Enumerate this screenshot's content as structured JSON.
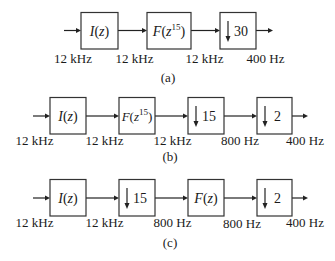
{
  "diagrams": {
    "a": {
      "caption": "(a)",
      "blocks": [
        {
          "kind": "filter",
          "func": "I",
          "arg": "z",
          "exp": ""
        },
        {
          "kind": "filter",
          "func": "F",
          "arg": "z",
          "exp": "15"
        },
        {
          "kind": "downsample",
          "factor": "30"
        }
      ],
      "rates": [
        "12 kHz",
        "12 kHz",
        "12 kHz",
        "400 Hz"
      ]
    },
    "b": {
      "caption": "(b)",
      "blocks": [
        {
          "kind": "filter",
          "func": "I",
          "arg": "z",
          "exp": ""
        },
        {
          "kind": "filter",
          "func": "F",
          "arg": "z",
          "exp": "15"
        },
        {
          "kind": "downsample",
          "factor": "15"
        },
        {
          "kind": "downsample",
          "factor": "2"
        }
      ],
      "rates": [
        "12 kHz",
        "12 kHz",
        "12 kHz",
        "800 Hz",
        "400 Hz"
      ]
    },
    "c": {
      "caption": "(c)",
      "blocks": [
        {
          "kind": "filter",
          "func": "I",
          "arg": "z",
          "exp": ""
        },
        {
          "kind": "downsample",
          "factor": "15"
        },
        {
          "kind": "filter",
          "func": "F",
          "arg": "z",
          "exp": ""
        },
        {
          "kind": "downsample",
          "factor": "2"
        }
      ],
      "rates": [
        "12 kHz",
        "12 kHz",
        "800 Hz",
        "800 Hz",
        "400 Hz"
      ]
    }
  }
}
